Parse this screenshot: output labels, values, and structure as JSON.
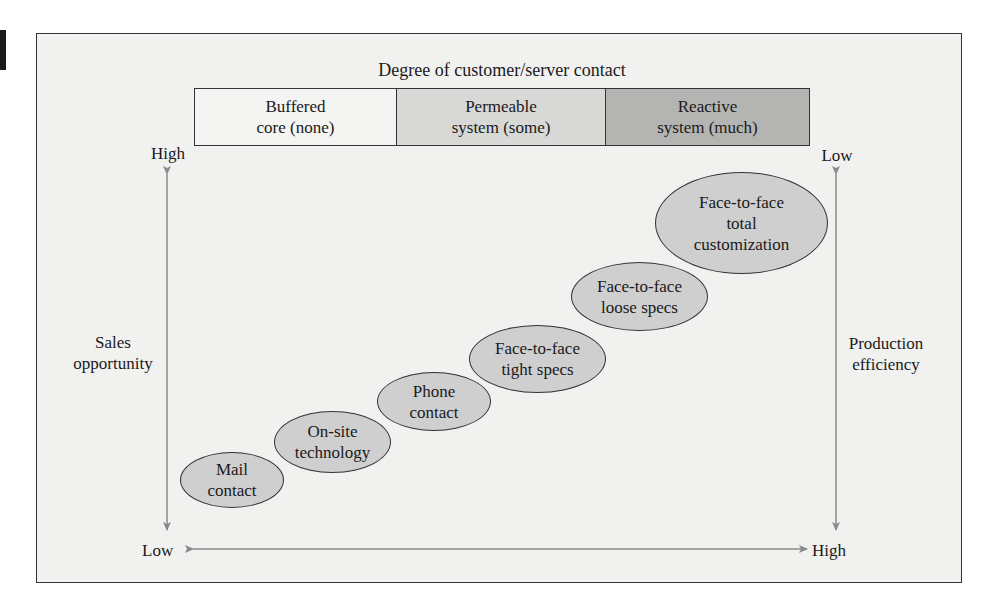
{
  "diagram": {
    "title": "Degree of customer/server contact",
    "contact_levels": [
      {
        "label": "Buffered\ncore (none)",
        "fill": "#f4f4f2"
      },
      {
        "label": "Permeable\nsystem (some)",
        "fill": "#d8d8d6"
      },
      {
        "label": "Reactive\nsystem (much)",
        "fill": "#b4b4b2"
      }
    ],
    "left_axis": {
      "label": "Sales\nopportunity",
      "top": "High",
      "bottom": "Low"
    },
    "right_axis": {
      "label": "Production\nefficiency",
      "top": "Low",
      "bottom": "High"
    },
    "bottom_axis": {
      "left": "Low",
      "right": "High"
    },
    "ellipses": [
      {
        "label": "Mail\ncontact"
      },
      {
        "label": "On-site\ntechnology"
      },
      {
        "label": "Phone\ncontact"
      },
      {
        "label": "Face-to-face\ntight specs"
      },
      {
        "label": "Face-to-face\nloose specs"
      },
      {
        "label": "Face-to-face\ntotal\ncustomization"
      }
    ],
    "colors": {
      "ellipse_fill": "#cfcfcf",
      "arrow": "#8a8a8a",
      "background": "#f1f1f0"
    }
  }
}
